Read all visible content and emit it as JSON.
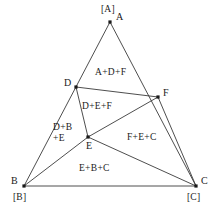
{
  "figure": {
    "type": "geometric-diagram",
    "width": 222,
    "height": 217,
    "stroke_color": "#3a3a3a",
    "text_color": "#1a1a1a",
    "background_color": "#ffffff"
  },
  "vertices": [
    {
      "id": "A",
      "label": "A",
      "x": 110,
      "y": 22,
      "label_dx": 6,
      "label_dy": -4
    },
    {
      "id": "B",
      "label": "B",
      "x": 24,
      "y": 186,
      "label_dx": -13,
      "label_dy": -4
    },
    {
      "id": "C",
      "label": "C",
      "x": 196,
      "y": 186,
      "label_dx": 5,
      "label_dy": -4
    },
    {
      "id": "D",
      "label": "D",
      "x": 76,
      "y": 87,
      "label_dx": -12,
      "label_dy": -3
    },
    {
      "id": "E",
      "label": "E",
      "x": 88,
      "y": 137,
      "label_dx": -2,
      "label_dy": 10
    },
    {
      "id": "F",
      "label": "F",
      "x": 158,
      "y": 97,
      "label_dx": 5,
      "label_dy": -3
    }
  ],
  "corner_brackets": [
    {
      "id": "bracket-A",
      "label": "[A]",
      "x": 101,
      "y": 4
    },
    {
      "id": "bracket-B",
      "label": "[B]",
      "x": 13,
      "y": 192
    },
    {
      "id": "bracket-C",
      "label": "[C]",
      "x": 187,
      "y": 192
    }
  ],
  "edges": [
    {
      "id": "A-B",
      "from": "A",
      "to": "B"
    },
    {
      "id": "A-C",
      "from": "A",
      "to": "C"
    },
    {
      "id": "B-C",
      "from": "B",
      "to": "C"
    },
    {
      "id": "D-F",
      "from": "D",
      "to": "F"
    },
    {
      "id": "D-E",
      "from": "D",
      "to": "E"
    },
    {
      "id": "E-F",
      "from": "E",
      "to": "F"
    },
    {
      "id": "E-B",
      "from": "E",
      "to": "B"
    },
    {
      "id": "E-C",
      "from": "E",
      "to": "C"
    },
    {
      "id": "F-C",
      "from": "F",
      "to": "C"
    }
  ],
  "regions": [
    {
      "id": "region-adf",
      "label": "A+D+F",
      "x": 95,
      "y": 67,
      "lines": [
        "A+D+F"
      ]
    },
    {
      "id": "region-def",
      "label": "D+E+F",
      "x": 82,
      "y": 101,
      "lines": [
        "D+E+F"
      ]
    },
    {
      "id": "region-dbe",
      "label": "D+B+E",
      "x": 53,
      "y": 122,
      "lines": [
        "D+B",
        "+E"
      ]
    },
    {
      "id": "region-fec",
      "label": "F+E+C",
      "x": 127,
      "y": 132,
      "lines": [
        "F+E+C"
      ]
    },
    {
      "id": "region-ebc",
      "label": "E+B+C",
      "x": 79,
      "y": 163,
      "lines": [
        "E+B+C"
      ]
    }
  ]
}
